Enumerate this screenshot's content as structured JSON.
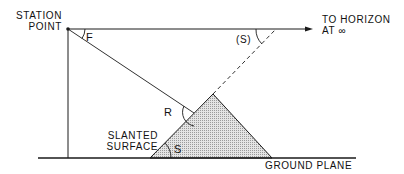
{
  "diagram": {
    "labels": {
      "station_point_line1": "STATION",
      "station_point_line2": "POINT",
      "angle_f": "F",
      "angle_s_projected": "(S)",
      "horizon_line1": "TO HORIZON",
      "horizon_line2": "AT ∞",
      "angle_r": "R",
      "slanted_surface_line1": "SLANTED",
      "slanted_surface_line2": "SURFACE",
      "angle_s": "S",
      "ground_plane": "GROUND PLANE"
    },
    "colors": {
      "line": "#1a1a1a",
      "hatch_fill": "#bdbdbd",
      "background": "#ffffff"
    }
  }
}
